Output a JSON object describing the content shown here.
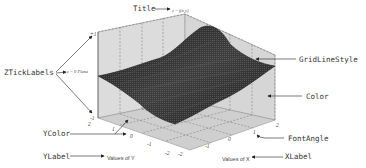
{
  "diagram": {
    "plot": {
      "title_text": "z = f(x,y)",
      "z_plane_label": "z = 0 Plane",
      "xlabel_text": "Values of X",
      "ylabel_text": "Values of Y",
      "z_ticks": [
        "+1",
        "-1"
      ],
      "x_ticks": [
        "-2",
        "-1",
        "0",
        "1",
        "2"
      ],
      "y_ticks": [
        "-2",
        "-1",
        "0",
        "1",
        "2"
      ],
      "surface_color": "#2a2a2a",
      "pane_color": "#d9d9d9",
      "grid_line_style": "dashed"
    },
    "annotations": {
      "title": "Title",
      "grid_line_style": "GridLineStyle",
      "z_tick_labels": "ZTickLabels",
      "color": "Color",
      "y_color": "YColor",
      "font_angle": "FontAngle",
      "y_label": "YLabel",
      "x_label": "XLabel"
    }
  }
}
